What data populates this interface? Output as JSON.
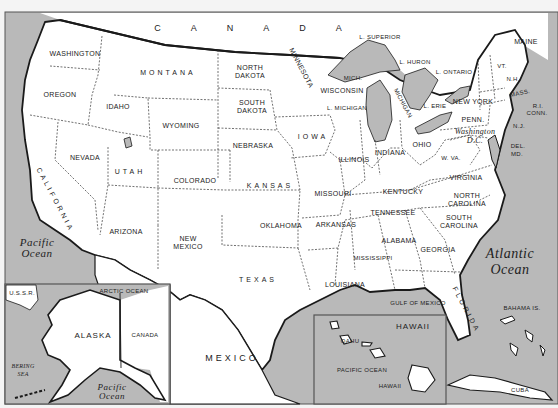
{
  "colors": {
    "water": "#b9b9b9",
    "land": "#ffffff",
    "border": "#1a1a1a",
    "frame": "#555555",
    "background": "#f4f4f4"
  },
  "countries": {
    "canada": "C A N A D A",
    "mexico": "MEXICO",
    "cuba": "CUBA",
    "ussr": "U.S.S.R.",
    "canada_inset": "CANADA"
  },
  "states": {
    "washington": "WASHINGTON",
    "oregon": "OREGON",
    "california": "CALIFORNIA",
    "nevada": "NEVADA",
    "idaho": "IDAHO",
    "montana": "MONTANA",
    "wyoming": "WYOMING",
    "utah": "UTAH",
    "colorado": "COLORADO",
    "arizona": "ARIZONA",
    "new_mexico": "NEW\nMEXICO",
    "north_dakota": "NORTH\nDAKOTA",
    "south_dakota": "SOUTH\nDAKOTA",
    "nebraska": "NEBRASKA",
    "kansas": "KANSAS",
    "oklahoma": "OKLAHOMA",
    "texas": "TEXAS",
    "minnesota": "MINNESOTA",
    "iowa": "IOWA",
    "missouri": "MISSOURI",
    "arkansas": "ARKANSAS",
    "louisiana": "LOUISIANA",
    "wisconsin": "WISCONSIN",
    "mich_upper": "MICH.",
    "michigan_label": "MICHIGAN",
    "l_michigan": "L. MICHIGAN",
    "illinois": "ILLINOIS",
    "indiana": "INDIANA",
    "ohio": "OHIO",
    "kentucky": "KENTUCKY",
    "tennessee": "TENNESSEE",
    "mississippi": "MISSISSIPPI",
    "alabama": "ALABAMA",
    "georgia": "GEORGIA",
    "florida": "FLORIDA",
    "south_carolina": "SOUTH\nCAROLINA",
    "north_carolina": "NORTH\nCAROLINA",
    "virginia": "VIRGINIA",
    "west_virginia": "W. VA.",
    "penn": "PENN.",
    "washington_dc": "Washington\nD.C.",
    "new_york": "NEW YORK",
    "maine": "MAINE",
    "vermont": "VT.",
    "new_hampshire": "N.H.",
    "mass": "MASS.",
    "rhode_island": "R.I.",
    "conn": "CONN.",
    "new_jersey": "N.J.",
    "delaware": "DEL.",
    "maryland": "MD.",
    "alaska": "ALASKA",
    "hawaii": "HAWAII",
    "oahu": "OAHU",
    "hawaii_island": "HAWAII"
  },
  "water_labels": {
    "l_superior": "L. SUPERIOR",
    "l_huron": "L. HURON",
    "l_ontario": "L. ONTARIO",
    "l_erie": "L. ERIE",
    "pacific": "Pacific\nOcean",
    "atlantic": "Atlantic\nOcean",
    "gulf": "GULF OF MEXICO",
    "bahama": "BAHAMA IS.",
    "arctic": "ARCTIC OCEAN",
    "bering": "BERING\nSEA",
    "pacific_ak": "Pacific\nOcean",
    "pacific_hi": "PACIFIC OCEAN"
  }
}
